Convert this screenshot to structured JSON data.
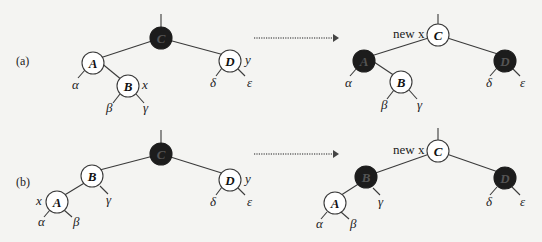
{
  "cases": [
    {
      "label": "(a)",
      "before": {
        "nodes": [
          {
            "id": "C",
            "color": "black"
          },
          {
            "id": "A",
            "color": "red"
          },
          {
            "id": "B",
            "color": "red",
            "tag": "x"
          },
          {
            "id": "D",
            "color": "red",
            "tag": "y"
          }
        ],
        "subtrees": [
          "α",
          "β",
          "γ",
          "δ",
          "ε"
        ]
      },
      "after": {
        "nodes": [
          {
            "id": "C",
            "color": "red",
            "tag": "new x"
          },
          {
            "id": "A",
            "color": "black"
          },
          {
            "id": "B",
            "color": "red"
          },
          {
            "id": "D",
            "color": "black"
          }
        ],
        "subtrees": [
          "α",
          "β",
          "γ",
          "δ",
          "ε"
        ]
      }
    },
    {
      "label": "(b)",
      "before": {
        "nodes": [
          {
            "id": "C",
            "color": "black"
          },
          {
            "id": "B",
            "color": "red"
          },
          {
            "id": "A",
            "color": "red",
            "tag": "x"
          },
          {
            "id": "D",
            "color": "red",
            "tag": "y"
          }
        ],
        "subtrees": [
          "α",
          "β",
          "γ",
          "δ",
          "ε"
        ]
      },
      "after": {
        "nodes": [
          {
            "id": "C",
            "color": "red",
            "tag": "new x"
          },
          {
            "id": "B",
            "color": "black"
          },
          {
            "id": "A",
            "color": "red"
          },
          {
            "id": "D",
            "color": "black"
          }
        ],
        "subtrees": [
          "α",
          "β",
          "γ",
          "δ",
          "ε"
        ]
      }
    }
  ],
  "labels": {
    "a": "(a)",
    "b": "(b)",
    "x": "x",
    "y": "y",
    "new_x": "new x",
    "A": "A",
    "B": "B",
    "C": "C",
    "D": "D",
    "alpha": "α",
    "beta": "β",
    "gamma": "γ",
    "delta": "δ",
    "epsilon": "ε"
  },
  "colors": {
    "black_node": "#1c1c1c",
    "red_node_fill": "#ffffff",
    "edge": "#3a3a3a"
  }
}
